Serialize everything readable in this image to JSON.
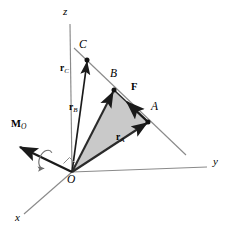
{
  "figure": {
    "background_color": "#ffffff",
    "width": 233,
    "height": 239
  },
  "colors": {
    "axis_line": "#8a8a8a",
    "action_line": "#8a8a8a",
    "vector": "#1a1a1a",
    "triangle_fill": "#c9c9c9",
    "triangle_stroke": "#2b2b2b",
    "text": "#000000",
    "curl_arrow": "#6e6e6e"
  },
  "axes": [
    {
      "name": "z-axis",
      "label": "z",
      "label_x": 63,
      "label_y": 8,
      "from": [
        72,
        172
      ],
      "to": [
        70,
        24
      ]
    },
    {
      "name": "y-axis",
      "label": "y",
      "label_x": 215,
      "label_y": 160,
      "from": [
        72,
        172
      ],
      "to": [
        207,
        167
      ]
    },
    {
      "name": "x-axis",
      "label": "x",
      "label_x": 17,
      "label_y": 216,
      "from": [
        72,
        172
      ],
      "to": [
        24,
        214
      ]
    }
  ],
  "origin": {
    "name": "origin",
    "label": "O",
    "point": [
      72,
      172
    ],
    "label_x": 68,
    "label_y": 176
  },
  "points": [
    {
      "name": "point-C",
      "label": "C",
      "x": 87,
      "y": 60,
      "label_x": 80,
      "label_y": 42,
      "dot": true
    },
    {
      "name": "point-B",
      "label": "B",
      "x": 114,
      "y": 90,
      "label_x": 111,
      "label_y": 71,
      "dot": true
    },
    {
      "name": "point-A",
      "label": "A",
      "x": 148,
      "y": 122,
      "label_x": 152,
      "label_y": 104,
      "dot": true
    }
  ],
  "action_line": {
    "name": "line-of-action",
    "from": [
      74,
      48
    ],
    "to": [
      186,
      155
    ]
  },
  "position_vectors": [
    {
      "name": "vector-r-C",
      "symbol": "r",
      "subscript": "C",
      "from": [
        72,
        172
      ],
      "to": [
        87,
        60
      ],
      "label_x": 62,
      "label_y": 68
    },
    {
      "name": "vector-r-B",
      "symbol": "r",
      "subscript": "B",
      "from": [
        72,
        172
      ],
      "to": [
        114,
        90
      ],
      "label_x": 71,
      "label_y": 107
    },
    {
      "name": "vector-r-A",
      "symbol": "r",
      "subscript": "A",
      "from": [
        72,
        172
      ],
      "to": [
        148,
        122
      ],
      "label_x": 118,
      "label_y": 137
    }
  ],
  "force_vector": {
    "name": "vector-F",
    "label": "F",
    "from": [
      148,
      122
    ],
    "to": [
      126,
      101
    ],
    "label_x": 133,
    "label_y": 85
  },
  "moment_vector": {
    "name": "vector-M-O",
    "symbol": "M",
    "subscript": "O",
    "from": [
      72,
      172
    ],
    "to": [
      18,
      146
    ],
    "label_x": 13,
    "label_y": 123,
    "curl": {
      "name": "moment-curl-arrow",
      "center": [
        45,
        159
      ],
      "rx": 6,
      "ry": 10,
      "rotation_deg": 25
    }
  },
  "shaded_triangle": {
    "name": "triangle-OBA",
    "vertices": [
      [
        72,
        172
      ],
      [
        114,
        90
      ],
      [
        148,
        122
      ]
    ],
    "fill": "#c9c9c9"
  },
  "right_angle_mark": {
    "name": "right-angle-mark",
    "at": [
      72,
      172
    ],
    "size": 8
  }
}
